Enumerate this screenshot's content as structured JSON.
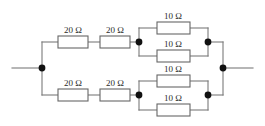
{
  "diagram": {
    "type": "electrical-circuit-schematic",
    "wire_color": "#7a7a7a",
    "node_color": "#111111",
    "resistor_fill": "#ffffff",
    "resistor_stroke": "#666666",
    "label_color": "#2b2b2b",
    "background": "#ffffff"
  },
  "labels": {
    "r_top_left_1": "20 Ω",
    "r_top_left_2": "20 Ω",
    "r_top_par_1": "10 Ω",
    "r_top_par_2": "10 Ω",
    "r_bot_left_1": "20 Ω",
    "r_bot_left_2": "20 Ω",
    "r_bot_par_1": "10 Ω",
    "r_bot_par_2": "10 Ω"
  },
  "components": [
    {
      "id": "r_top_left_1",
      "value": "20 Ω",
      "ohms": 20,
      "branch": "top",
      "group": "series"
    },
    {
      "id": "r_top_left_2",
      "value": "20 Ω",
      "ohms": 20,
      "branch": "top",
      "group": "series"
    },
    {
      "id": "r_top_par_1",
      "value": "10 Ω",
      "ohms": 10,
      "branch": "top",
      "group": "parallel"
    },
    {
      "id": "r_top_par_2",
      "value": "10 Ω",
      "ohms": 10,
      "branch": "top",
      "group": "parallel"
    },
    {
      "id": "r_bot_left_1",
      "value": "20 Ω",
      "ohms": 20,
      "branch": "bottom",
      "group": "series"
    },
    {
      "id": "r_bot_left_2",
      "value": "20 Ω",
      "ohms": 20,
      "branch": "bottom",
      "group": "series"
    },
    {
      "id": "r_bot_par_1",
      "value": "10 Ω",
      "ohms": 10,
      "branch": "bottom",
      "group": "parallel"
    },
    {
      "id": "r_bot_par_2",
      "value": "10 Ω",
      "ohms": 10,
      "branch": "bottom",
      "group": "parallel"
    }
  ],
  "nodes": [
    {
      "id": "node-left-terminal",
      "x": 42,
      "y": 68
    },
    {
      "id": "node-top-mid",
      "x": 139,
      "y": 42
    },
    {
      "id": "node-top-right",
      "x": 208,
      "y": 42
    },
    {
      "id": "node-bottom-mid",
      "x": 139,
      "y": 95
    },
    {
      "id": "node-bottom-right",
      "x": 208,
      "y": 95
    },
    {
      "id": "node-right-terminal",
      "x": 223,
      "y": 68
    }
  ]
}
